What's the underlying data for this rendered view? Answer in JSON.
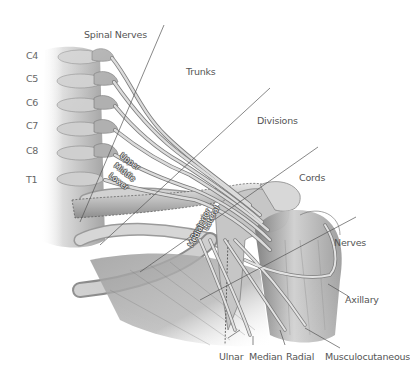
{
  "diagram": {
    "vertebra_labels": [
      "C4",
      "C5",
      "C6",
      "C7",
      "C8",
      "T1"
    ],
    "section_labels": {
      "spinal_nerves": "Spinal Nerves",
      "trunks": "Trunks",
      "divisions": "Divisions",
      "cords": "Cords",
      "nerves": "Nerves"
    },
    "trunk_labels": [
      "Upper",
      "Middle",
      "Lower"
    ],
    "cord_labels": [
      "Lateral",
      "Posterior",
      "Medial"
    ],
    "nerve_labels": {
      "axillary": "Axillary",
      "ulnar": "Ulnar",
      "median": "Median",
      "radial": "Radial",
      "musculocutaneous": "Musculocutaneous"
    }
  }
}
